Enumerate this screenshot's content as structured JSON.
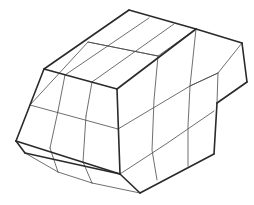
{
  "diagram": {
    "title": "3D hexahedral mesh wireframe",
    "background": "#ffffff",
    "line_color": "#2a2a2a",
    "outline": [
      [
        [
          44,
          69
        ],
        [
          129,
          10
        ]
      ],
      [
        [
          129,
          10
        ],
        [
          196,
          29
        ]
      ],
      [
        [
          196,
          29
        ],
        [
          242,
          43
        ]
      ],
      [
        [
          242,
          43
        ],
        [
          247,
          82
        ]
      ],
      [
        [
          247,
          82
        ],
        [
          217,
          103
        ]
      ],
      [
        [
          217,
          103
        ],
        [
          214,
          154
        ]
      ],
      [
        [
          214,
          154
        ],
        [
          140,
          193
        ]
      ],
      [
        [
          140,
          193
        ],
        [
          120,
          174
        ]
      ],
      [
        [
          120,
          174
        ],
        [
          25,
          153
        ]
      ],
      [
        [
          25,
          153
        ],
        [
          16,
          141
        ]
      ],
      [
        [
          16,
          141
        ],
        [
          44,
          69
        ]
      ],
      [
        [
          44,
          69
        ],
        [
          117,
          89
        ]
      ],
      [
        [
          117,
          89
        ],
        [
          196,
          29
        ]
      ],
      [
        [
          117,
          89
        ],
        [
          120,
          174
        ]
      ],
      [
        [
          16,
          141
        ],
        [
          120,
          174
        ]
      ]
    ],
    "grid_lines": [
      [
        [
          65,
          75
        ],
        [
          149,
          18
        ]
      ],
      [
        [
          92,
          82
        ],
        [
          174,
          24
        ]
      ],
      [
        [
          30,
          105
        ],
        [
          88,
          42
        ],
        [
          158,
          56
        ],
        [
          196,
          29
        ]
      ],
      [
        [
          88,
          42
        ],
        [
          158,
          56
        ]
      ],
      [
        [
          30,
          105
        ],
        [
          118,
          129
        ]
      ],
      [
        [
          118,
          129
        ],
        [
          190,
          86
        ],
        [
          218,
          73
        ],
        [
          242,
          43
        ]
      ],
      [
        [
          58,
          111
        ],
        [
          65,
          75
        ]
      ],
      [
        [
          50,
          148
        ],
        [
          58,
          111
        ]
      ],
      [
        [
          86,
          116
        ],
        [
          92,
          82
        ]
      ],
      [
        [
          83,
          162
        ],
        [
          86,
          116
        ]
      ],
      [
        [
          50,
          148
        ],
        [
          58,
          172
        ]
      ],
      [
        [
          83,
          162
        ],
        [
          92,
          183
        ]
      ],
      [
        [
          25,
          153
        ],
        [
          58,
          172
        ]
      ],
      [
        [
          58,
          172
        ],
        [
          92,
          183
        ]
      ],
      [
        [
          92,
          183
        ],
        [
          140,
          193
        ]
      ],
      [
        [
          120,
          174
        ],
        [
          166,
          144
        ],
        [
          214,
          111
        ]
      ],
      [
        [
          158,
          56
        ],
        [
          154,
          100
        ],
        [
          152,
          150
        ],
        [
          157,
          180
        ]
      ],
      [
        [
          196,
          29
        ],
        [
          190,
          86
        ],
        [
          188,
          126
        ],
        [
          188,
          166
        ]
      ],
      [
        [
          218,
          73
        ],
        [
          217,
          103
        ]
      ],
      [
        [
          190,
          86
        ],
        [
          218,
          73
        ]
      ]
    ]
  }
}
